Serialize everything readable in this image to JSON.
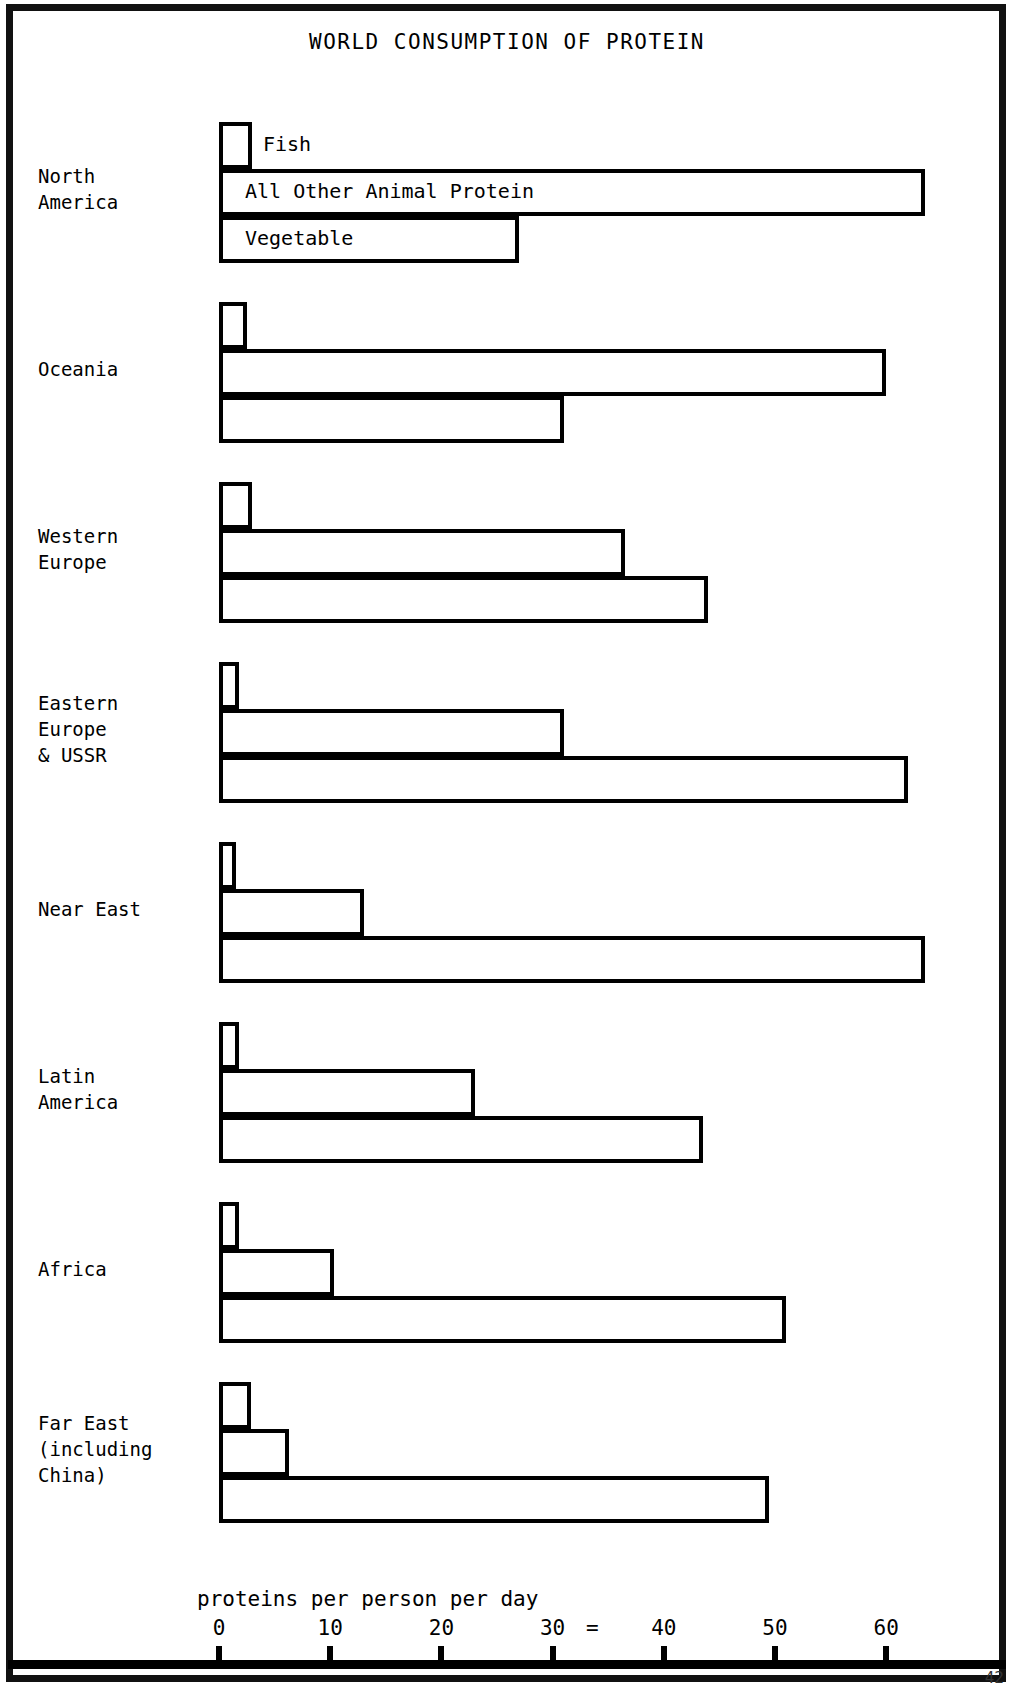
{
  "document": {
    "title": "WORLD CONSUMPTION OF PROTEIN",
    "page_number": "42"
  },
  "chart_data": {
    "type": "bar",
    "orientation": "horizontal",
    "title": "WORLD CONSUMPTION OF PROTEIN",
    "xlabel": "proteins per person per day",
    "ylabel": "",
    "xlim": [
      0,
      65
    ],
    "xticks": [
      0,
      10,
      20,
      30,
      40,
      50,
      60
    ],
    "xtick_labels": [
      "0",
      "10",
      "20",
      "30",
      "40",
      "50",
      "60"
    ],
    "grid": false,
    "legend_position": "inline-first-group",
    "annotations": [
      "="
    ],
    "series": [
      {
        "name": "Fish",
        "values": [
          3,
          2.5,
          3,
          1.8,
          1.5,
          1.8,
          1.8,
          2.9
        ]
      },
      {
        "name": "All Other Animal Protein",
        "values": [
          63.5,
          60,
          36.5,
          31,
          13,
          23,
          10.3,
          6.3
        ]
      },
      {
        "name": "Vegetable",
        "values": [
          27,
          31,
          44,
          62,
          63.5,
          43.5,
          51,
          49.5
        ]
      }
    ],
    "categories": [
      "North\nAmerica",
      "Oceania",
      "Western\nEurope",
      "Eastern\nEurope\n& USSR",
      "Near East",
      "Latin\nAmerica",
      "Africa",
      "Far East\n(including\nChina)"
    ]
  },
  "colors": {
    "ink": "#000000",
    "paper": "#ffffff"
  }
}
